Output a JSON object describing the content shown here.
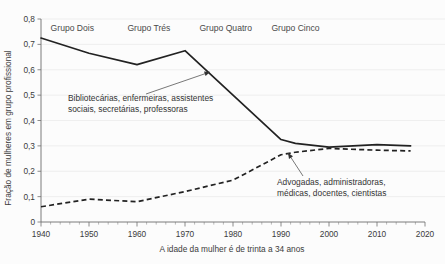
{
  "chart_data": {
    "type": "line",
    "title": "",
    "subtitle": "",
    "xlabel": "A idade da mulher é de trinta a 34 anos",
    "ylabel": "Fração de mulheres em grupo profissional",
    "xlim": [
      1940,
      2020
    ],
    "ylim": [
      0,
      0.8
    ],
    "grid": true,
    "legend_position": "none",
    "x_tick_labels": [
      "1940",
      "1950",
      "1960",
      "1970",
      "1980",
      "1990",
      "2000",
      "2010",
      "2020"
    ],
    "x_ticks": [
      1940,
      1950,
      1960,
      1970,
      1980,
      1990,
      2000,
      2010,
      2020
    ],
    "y_tick_labels": [
      "0",
      "0,1",
      "0,2",
      "0,3",
      "0,4",
      "0,5",
      "0,6",
      "0,7",
      "0,8"
    ],
    "y_ticks": [
      0,
      0.1,
      0.2,
      0.3,
      0.4,
      0.5,
      0.6,
      0.7,
      0.8
    ],
    "x": [
      1940,
      1950,
      1960,
      1970,
      1980,
      1990,
      1993,
      2000,
      2010,
      2017
    ],
    "series": [
      {
        "name": "Bibliotecárias, enfermeiras, assistentes sociais, secretárias, professoras",
        "style": "solid",
        "values": [
          0.725,
          0.665,
          0.62,
          0.675,
          0.5,
          0.325,
          0.31,
          0.295,
          0.305,
          0.3
        ]
      },
      {
        "name": "Advogadas, administradoras, médicas, docentes, cientistas",
        "style": "dashed",
        "values": [
          0.06,
          0.09,
          0.08,
          0.12,
          0.165,
          0.265,
          0.275,
          0.29,
          0.283,
          0.28
        ]
      }
    ],
    "annotations": [
      {
        "id": "annotation-traditional",
        "line1": "Bibliotecárias, enfermeiras, assistentes",
        "line2": "sociais, secretárias, professoras",
        "target_x": 1975,
        "target_y": 0.6
      },
      {
        "id": "annotation-professional",
        "line1": "Advogadas, administradoras,",
        "line2": "médicas, docentes, cientistas",
        "target_x": 1992,
        "target_y": 0.272
      }
    ],
    "group_labels": [
      {
        "text": "Grupo Dois",
        "x": 1942
      },
      {
        "text": "Grupo Trés",
        "x": 1958
      },
      {
        "text": "Grupo Quatro",
        "x": 1973
      },
      {
        "text": "Grupo Cinco",
        "x": 1988
      }
    ],
    "colors": {
      "line": "#222222",
      "grid": "#ebebeb",
      "axis": "#6e6e6e",
      "text": "#3b3b3b",
      "background": "#fcfcfc"
    }
  }
}
